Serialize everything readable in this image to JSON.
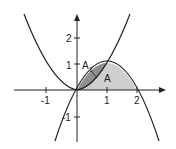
{
  "figure": {
    "type": "function-graph",
    "curves": [
      {
        "name": "parabola-up",
        "expression": "y = x^2"
      },
      {
        "name": "parabola-down",
        "expression": "y = 2x - x^2"
      }
    ],
    "regions": [
      {
        "label": "A1",
        "description": "between y=x^2 and y=2x-x^2 for 0<=x<=1",
        "fill": "#8c8c8c"
      },
      {
        "label": "A",
        "description": "under y=2x-x^2 above x-axis",
        "fill": "#c8c8c8"
      }
    ],
    "x_ticks": [
      "-1",
      "1",
      "2"
    ],
    "y_ticks": [
      "2",
      "1",
      "-1"
    ],
    "labels": {
      "a1_main": "A",
      "a1_sub": "1",
      "a": "A"
    }
  }
}
